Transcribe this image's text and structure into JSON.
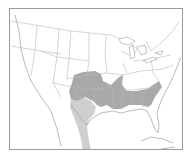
{
  "map": {
    "type": "range-map",
    "region": "United States (contiguous) with southern Canada and northern Mexico",
    "colors": {
      "background": "#ffffff",
      "border_lines": "#b8b8b8",
      "frame": "#9a9a9a",
      "range_primary": "#a9a9a9",
      "range_secondary": "#cfcfcf"
    },
    "legend": [],
    "labels": []
  }
}
